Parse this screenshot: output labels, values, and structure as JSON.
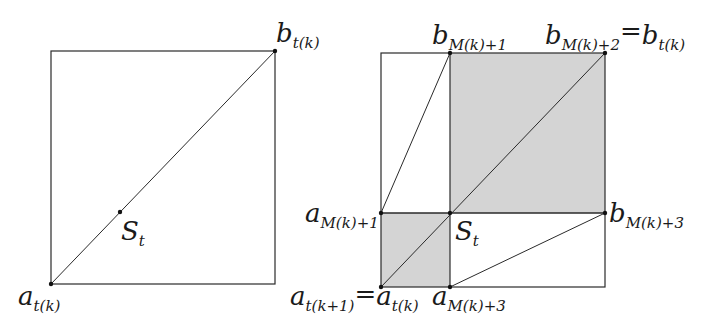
{
  "figure": {
    "colors": {
      "line": "#2a2a2a",
      "shade": "#d4d4d4",
      "background": "#ffffff"
    },
    "left_panel": {
      "labels": {
        "top_right": {
          "main": "b",
          "sub": "t(k)"
        },
        "bottom_left": {
          "main": "a",
          "sub": "t(k)"
        },
        "center": {
          "main": "S",
          "sub": "t"
        }
      }
    },
    "right_panel": {
      "labels": {
        "top_mid": {
          "main": "b",
          "sub": "M(k)+1"
        },
        "top_right": {
          "main": "b",
          "sub": "M(k)+2",
          "eq": "=",
          "main2": "b",
          "sub2": "t(k)"
        },
        "mid_left": {
          "main": "a",
          "sub": "M(k)+1"
        },
        "mid_right": {
          "main": "b",
          "sub": "M(k)+3"
        },
        "center": {
          "main": "S",
          "sub": "t"
        },
        "bottom_left": {
          "main": "a",
          "sub": "t(k+1)",
          "eq": "=",
          "main2": "a",
          "sub2": "t(k)"
        },
        "bottom_mid": {
          "main": "a",
          "sub": "M(k)+3"
        }
      }
    }
  }
}
